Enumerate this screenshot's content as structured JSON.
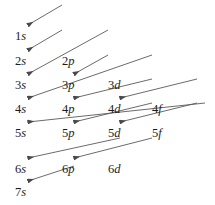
{
  "diagram": {
    "background_color": "#ffffff",
    "text_color": "#1c1c1c",
    "arrow_color": "#5a5a5a",
    "width": 215,
    "height": 205,
    "column_x": [
      15,
      62,
      108,
      152
    ],
    "row_y": [
      30,
      55,
      79,
      103,
      127,
      163,
      186
    ],
    "subshell_columns": [
      "s",
      "p",
      "d",
      "f"
    ],
    "labels": [
      {
        "text": "1s",
        "shell": "1",
        "subshell": "s",
        "col": 0,
        "row": 0,
        "x": 15,
        "y": 30
      },
      {
        "text": "2s",
        "shell": "2",
        "subshell": "s",
        "col": 0,
        "row": 1,
        "x": 15,
        "y": 55
      },
      {
        "text": "2p",
        "shell": "2",
        "subshell": "p",
        "col": 1,
        "row": 1,
        "x": 62,
        "y": 55
      },
      {
        "text": "3s",
        "shell": "3",
        "subshell": "s",
        "col": 0,
        "row": 2,
        "x": 15,
        "y": 79
      },
      {
        "text": "3p",
        "shell": "3",
        "subshell": "p",
        "col": 1,
        "row": 2,
        "x": 62,
        "y": 79
      },
      {
        "text": "3d",
        "shell": "3",
        "subshell": "d",
        "col": 2,
        "row": 2,
        "x": 108,
        "y": 79
      },
      {
        "text": "4s",
        "shell": "4",
        "subshell": "s",
        "col": 0,
        "row": 3,
        "x": 15,
        "y": 103
      },
      {
        "text": "4p",
        "shell": "4",
        "subshell": "p",
        "col": 1,
        "row": 3,
        "x": 62,
        "y": 103
      },
      {
        "text": "4d",
        "shell": "4",
        "subshell": "d",
        "col": 2,
        "row": 3,
        "x": 108,
        "y": 103
      },
      {
        "text": "4f",
        "shell": "4",
        "subshell": "f",
        "col": 3,
        "row": 3,
        "x": 152,
        "y": 103
      },
      {
        "text": "5s",
        "shell": "5",
        "subshell": "s",
        "col": 0,
        "row": 4,
        "x": 15,
        "y": 127
      },
      {
        "text": "5p",
        "shell": "5",
        "subshell": "p",
        "col": 1,
        "row": 4,
        "x": 62,
        "y": 127
      },
      {
        "text": "5d",
        "shell": "5",
        "subshell": "d",
        "col": 2,
        "row": 4,
        "x": 108,
        "y": 127
      },
      {
        "text": "5f",
        "shell": "5",
        "subshell": "f",
        "col": 3,
        "row": 4,
        "x": 152,
        "y": 127
      },
      {
        "text": "6s",
        "shell": "6",
        "subshell": "s",
        "col": 0,
        "row": 5,
        "x": 15,
        "y": 163
      },
      {
        "text": "6p",
        "shell": "6",
        "subshell": "p",
        "col": 1,
        "row": 5,
        "x": 62,
        "y": 163
      },
      {
        "text": "6d",
        "shell": "6",
        "subshell": "d",
        "col": 2,
        "row": 5,
        "x": 108,
        "y": 163
      },
      {
        "text": "7s",
        "shell": "7",
        "subshell": "s",
        "col": 0,
        "row": 6,
        "x": 15,
        "y": 186
      }
    ],
    "arrows": [
      {
        "name": "arrow-1s",
        "from_x": 62,
        "from_y": 5,
        "to_x": 28,
        "to_y": 25
      },
      {
        "name": "arrow-2s",
        "from_x": 62,
        "from_y": 30,
        "to_x": 28,
        "to_y": 50
      },
      {
        "name": "arrow-2p-3s",
        "from_x": 108,
        "from_y": 30,
        "to_x": 28,
        "to_y": 74
      },
      {
        "name": "arrow-3p",
        "from_x": 108,
        "from_y": 55,
        "to_x": 74,
        "to_y": 74
      },
      {
        "name": "arrow-3d-4s",
        "from_x": 152,
        "from_y": 55,
        "to_x": 28,
        "to_y": 98
      },
      {
        "name": "arrow-4p",
        "from_x": 152,
        "from_y": 79,
        "to_x": 74,
        "to_y": 98
      },
      {
        "name": "arrow-4d",
        "from_x": 197,
        "from_y": 79,
        "to_x": 120,
        "to_y": 98
      },
      {
        "name": "arrow-4f-5s",
        "from_x": 205,
        "from_y": 103,
        "to_x": 28,
        "to_y": 122
      },
      {
        "name": "arrow-5p",
        "from_x": 152,
        "from_y": 103,
        "to_x": 74,
        "to_y": 122
      },
      {
        "name": "arrow-5d",
        "from_x": 197,
        "from_y": 103,
        "to_x": 120,
        "to_y": 122
      },
      {
        "name": "arrow-5f-6s",
        "from_x": 120,
        "from_y": 138,
        "to_x": 28,
        "to_y": 158
      },
      {
        "name": "arrow-6p",
        "from_x": 152,
        "from_y": 138,
        "to_x": 74,
        "to_y": 158
      },
      {
        "name": "arrow-6d-7s",
        "from_x": 74,
        "from_y": 166,
        "to_x": 28,
        "to_y": 181
      }
    ]
  }
}
